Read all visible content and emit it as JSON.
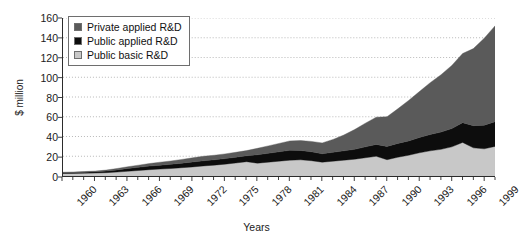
{
  "chart_data": {
    "type": "area",
    "stacked": true,
    "title": "",
    "xlabel": "Years",
    "ylabel": "$ million",
    "ylim": [
      0,
      160
    ],
    "ytick_step": 20,
    "yticks": [
      0,
      20,
      40,
      60,
      80,
      100,
      120,
      140,
      160
    ],
    "grid": true,
    "grid_style": "dotted-horizontal",
    "legend_position": "top-left-inside",
    "x_tick_labels": [
      "1960",
      "1963",
      "1966",
      "1969",
      "1972",
      "1975",
      "1978",
      "1981",
      "1984",
      "1987",
      "1990",
      "1993",
      "1996",
      "1999"
    ],
    "x_minor_ticks": "every year",
    "x": [
      1960,
      1961,
      1962,
      1963,
      1964,
      1965,
      1966,
      1967,
      1968,
      1969,
      1970,
      1971,
      1972,
      1973,
      1974,
      1975,
      1976,
      1977,
      1978,
      1979,
      1980,
      1981,
      1982,
      1983,
      1984,
      1985,
      1986,
      1987,
      1988,
      1989,
      1990,
      1991,
      1992,
      1993,
      1994,
      1995,
      1996,
      1997,
      1998,
      1999,
      2000
    ],
    "series": [
      {
        "name": "Public basic R&D",
        "color": "#c8c8c8",
        "values": [
          2.5,
          2.6,
          2.8,
          3.0,
          3.4,
          4.0,
          4.8,
          5.6,
          6.4,
          7.0,
          7.6,
          8.4,
          9.2,
          10.2,
          11.0,
          12.0,
          13.2,
          14.5,
          13.0,
          14.0,
          15.0,
          16.0,
          16.4,
          15.5,
          14.0,
          15.0,
          16.0,
          17.0,
          18.5,
          20.0,
          16.5,
          19.0,
          21.0,
          23.5,
          25.5,
          27.0,
          29.5,
          34.0,
          28.5,
          27.5,
          30.0
        ]
      },
      {
        "name": "Public applied R&D",
        "color": "#0d0d0d",
        "values": [
          0.8,
          0.9,
          1.0,
          1.2,
          1.6,
          2.2,
          2.8,
          3.2,
          3.6,
          4.0,
          4.2,
          4.6,
          5.0,
          5.2,
          5.4,
          5.6,
          5.8,
          6.0,
          8.5,
          9.0,
          9.5,
          10.0,
          9.5,
          9.0,
          8.5,
          9.0,
          9.5,
          10.0,
          11.0,
          12.0,
          13.5,
          14.0,
          14.5,
          15.5,
          16.5,
          17.5,
          18.5,
          20.0,
          22.5,
          24.0,
          25.0
        ]
      },
      {
        "name": "Private applied R&D",
        "color": "#5a5a5a",
        "values": [
          0.5,
          0.6,
          0.7,
          0.8,
          1.0,
          1.4,
          1.8,
          2.2,
          2.6,
          3.0,
          3.4,
          3.8,
          4.2,
          4.6,
          4.6,
          4.8,
          5.0,
          5.2,
          6.5,
          7.5,
          8.5,
          9.5,
          10.0,
          10.5,
          11.0,
          13.0,
          16.0,
          20.0,
          24.0,
          27.5,
          30.0,
          35.0,
          41.0,
          46.5,
          52.5,
          58.0,
          64.0,
          70.0,
          78.0,
          88.0,
          97.0
        ]
      }
    ],
    "totals_note": "stack order bottom-to-top: Public basic R&D, Public applied R&D, Private applied R&D"
  },
  "legend": {
    "items": [
      {
        "label": "Private applied R&D",
        "color": "#5a5a5a",
        "swatch_name": "legend-swatch-private-applied"
      },
      {
        "label": "Public applied R&D",
        "color": "#0d0d0d",
        "swatch_name": "legend-swatch-public-applied"
      },
      {
        "label": "Public basic R&D",
        "color": "#c8c8c8",
        "swatch_name": "legend-swatch-public-basic"
      }
    ]
  },
  "axes": {
    "y_title": "$ million",
    "x_title": "Years"
  }
}
